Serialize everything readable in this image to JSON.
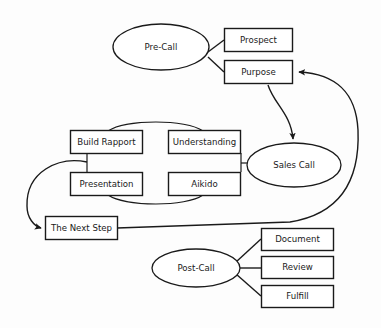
{
  "diagram": {
    "type": "flowchart",
    "background_color": "#fdfdfd",
    "line_color": "#1a1a1a",
    "node_fill": "#ffffff",
    "nodes": {
      "pre_call": {
        "label": "Pre-Call",
        "shape": "ellipse"
      },
      "prospect": {
        "label": "Prospect",
        "shape": "rect"
      },
      "purpose": {
        "label": "Purpose",
        "shape": "rect"
      },
      "build_rapport": {
        "label": "Build Rapport",
        "shape": "rect"
      },
      "understanding": {
        "label": "Understanding",
        "shape": "rect"
      },
      "presentation": {
        "label": "Presentation",
        "shape": "rect"
      },
      "aikido": {
        "label": "Aikido",
        "shape": "rect"
      },
      "sales_call": {
        "label": "Sales Call",
        "shape": "ellipse"
      },
      "next_step": {
        "label": "The Next Step",
        "shape": "rect"
      },
      "post_call": {
        "label": "Post-Call",
        "shape": "ellipse"
      },
      "document": {
        "label": "Document",
        "shape": "rect"
      },
      "review": {
        "label": "Review",
        "shape": "rect"
      },
      "fulfill": {
        "label": "Fulfill",
        "shape": "rect"
      }
    },
    "edges": [
      {
        "from": "pre_call",
        "to": "prospect",
        "arrow": false
      },
      {
        "from": "pre_call",
        "to": "purpose",
        "arrow": false
      },
      {
        "from": "purpose",
        "to": "sales_call",
        "arrow": true
      },
      {
        "from": "build_rapport",
        "to": "understanding",
        "arrow": false
      },
      {
        "from": "presentation",
        "to": "aikido",
        "arrow": false
      },
      {
        "from": "build_rapport",
        "to": "presentation",
        "arrow": false
      },
      {
        "from": "understanding",
        "to": "aikido",
        "arrow": false
      },
      {
        "from": "aikido",
        "to": "sales_call",
        "arrow": false
      },
      {
        "from": "build_rapport",
        "to": "next_step",
        "arrow": true
      },
      {
        "from": "next_step",
        "to": "purpose",
        "arrow": true
      },
      {
        "from": "post_call",
        "to": "document",
        "arrow": false
      },
      {
        "from": "post_call",
        "to": "review",
        "arrow": false
      },
      {
        "from": "post_call",
        "to": "fulfill",
        "arrow": false
      }
    ]
  }
}
